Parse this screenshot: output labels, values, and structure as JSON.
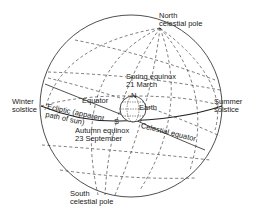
{
  "diagram": {
    "labels": {
      "north_pole": [
        "North",
        "celestial pole"
      ],
      "spring_equinox": [
        "Spring equinox",
        "21 March"
      ],
      "winter_solstice": [
        "Winter",
        "solstice"
      ],
      "summer_solstice": [
        "Summer",
        "solstice"
      ],
      "equator": "Equator",
      "ecliptic": [
        "Ecliptic (apparent",
        "path of sun)"
      ],
      "earth": "Earth",
      "n_marker": "N",
      "s_marker": "S",
      "autumn_equinox": [
        "Autumn equinox",
        "23 September"
      ],
      "celestial_equator": "Celestial equator",
      "south_pole": [
        "South",
        "celestial pole"
      ]
    },
    "colors": {
      "ink": "#222222",
      "background": "#ffffff"
    }
  }
}
